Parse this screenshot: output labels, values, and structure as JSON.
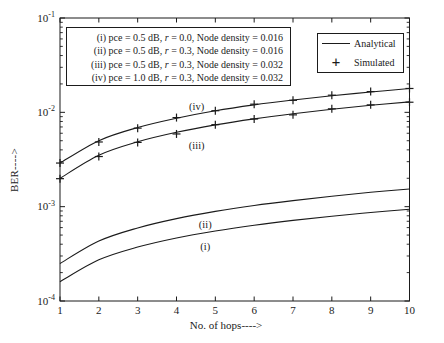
{
  "figure": {
    "background": "#ffffff",
    "ink": "#1b1b1b"
  },
  "annotation_box": {
    "lines": [
      {
        "pre": "(i) pce = 0.5 dB, ",
        "r": "r",
        "post": " = 0.0, Node density = 0.016"
      },
      {
        "pre": "(ii) pce = 0.5 dB, ",
        "r": "r",
        "post": " = 0.3, Node density = 0.016"
      },
      {
        "pre": "(iii) pce = 0.5 dB, ",
        "r": "r",
        "post": " = 0.3, Node density = 0.032"
      },
      {
        "pre": "(iv) pce = 1.0 dB, ",
        "r": "r",
        "post": " = 0.3, Node density = 0.032"
      }
    ]
  },
  "legend": {
    "entries": [
      {
        "label": "Analytical",
        "marker": "line"
      },
      {
        "label": "Simulated",
        "marker": "plus",
        "marker_glyph": "+"
      }
    ]
  },
  "chart_data": {
    "type": "line",
    "title": "",
    "xlabel": "No. of hops---->",
    "ylabel": "BER---->",
    "x_axis_scale": "linear",
    "y_axis_scale": "log",
    "xlim": [
      1,
      10
    ],
    "ylim_log10": [
      -4,
      -1
    ],
    "grid": false,
    "legend_position": "upper right",
    "x_ticks": [
      1,
      2,
      3,
      4,
      5,
      6,
      7,
      8,
      9,
      10
    ],
    "y_ticks": [
      {
        "base": "10",
        "exp": "-1",
        "value": 0.1
      },
      {
        "base": "10",
        "exp": "-2",
        "value": 0.01
      },
      {
        "base": "10",
        "exp": "-3",
        "value": 0.001
      },
      {
        "base": "10",
        "exp": "-4",
        "value": 0.0001
      }
    ],
    "x": [
      1,
      2,
      3,
      4,
      5,
      6,
      7,
      8,
      9,
      10
    ],
    "series": [
      {
        "id": "i-analytical",
        "label": "(i)",
        "render": "line",
        "values": [
          0.00016,
          0.000273,
          0.000373,
          0.000466,
          0.000552,
          0.000635,
          0.000715,
          0.000792,
          0.000867,
          0.00094
        ]
      },
      {
        "id": "ii-analytical",
        "label": "(ii)",
        "render": "line",
        "values": [
          0.00025,
          0.000432,
          0.000595,
          0.000747,
          0.000892,
          0.00103,
          0.00116,
          0.00129,
          0.00142,
          0.00154
        ]
      },
      {
        "id": "iii-analytical",
        "label": "(iii)",
        "render": "line",
        "values": [
          0.002,
          0.00351,
          0.00487,
          0.00614,
          0.00736,
          0.00853,
          0.00967,
          0.0108,
          0.0119,
          0.0129
        ]
      },
      {
        "id": "iv-analytical",
        "label": "(iv)",
        "render": "line",
        "values": [
          0.0029,
          0.00501,
          0.0069,
          0.00866,
          0.0104,
          0.012,
          0.0135,
          0.015,
          0.0164,
          0.0179
        ]
      },
      {
        "id": "iii-simulated",
        "label": "(iii) simulated",
        "render": "plus",
        "values": [
          0.00198,
          0.0034,
          0.0048,
          0.0059,
          0.0074,
          0.0085,
          0.0094,
          0.0109,
          0.012,
          0.0128
        ]
      },
      {
        "id": "iv-simulated",
        "label": "(iv) simulated",
        "render": "plus",
        "values": [
          0.0029,
          0.00485,
          0.0068,
          0.0088,
          0.0104,
          0.0122,
          0.0134,
          0.0152,
          0.0166,
          0.0179
        ]
      }
    ],
    "annotations": [
      {
        "text": "(iv)",
        "x": 4.52,
        "y": 0.0114
      },
      {
        "text": "(iii)",
        "x": 4.52,
        "y": 0.0044
      },
      {
        "text": "(ii)",
        "x": 4.74,
        "y": 0.00065
      },
      {
        "text": "(i)",
        "x": 4.74,
        "y": 0.00038
      }
    ]
  }
}
